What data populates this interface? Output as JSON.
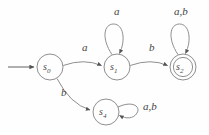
{
  "diagram": {
    "type": "finite-state-automaton",
    "stroke_color": "#8a8a8a",
    "text_color": "#3f3f3f",
    "background_color": "#fefefe",
    "alphabet": [
      "a",
      "b"
    ],
    "states": [
      {
        "id": "s0",
        "label": "s",
        "subscript": "0",
        "cx": 50,
        "cy": 67,
        "r": 13,
        "accepting": false,
        "start": true
      },
      {
        "id": "s1",
        "label": "s",
        "subscript": "1",
        "cx": 117,
        "cy": 67,
        "r": 13,
        "accepting": false,
        "start": false
      },
      {
        "id": "s2",
        "label": "s",
        "subscript": "2",
        "cx": 183,
        "cy": 67,
        "r": 13,
        "accepting": true,
        "start": false
      },
      {
        "id": "s4",
        "label": "s",
        "subscript": "4",
        "cx": 106,
        "cy": 112,
        "r": 13,
        "accepting": false,
        "start": false
      }
    ],
    "transitions": [
      {
        "id": "t-start",
        "from": "start",
        "to": "s0",
        "label": ""
      },
      {
        "id": "t-s0-s1",
        "from": "s0",
        "to": "s1",
        "label": "a",
        "label_x": 82,
        "label_y": 48
      },
      {
        "id": "t-s1-s1",
        "from": "s1",
        "to": "s1",
        "label": "a",
        "label_x": 114,
        "label_y": 12,
        "self_loop": true
      },
      {
        "id": "t-s1-s2",
        "from": "s1",
        "to": "s2",
        "label": "b",
        "label_x": 149,
        "label_y": 48
      },
      {
        "id": "t-s2-s2",
        "from": "s2",
        "to": "s2",
        "label": "a,b",
        "label_x": 176,
        "label_y": 12,
        "self_loop": true
      },
      {
        "id": "t-s0-s4",
        "from": "s0",
        "to": "s4",
        "label": "b",
        "label_x": 62,
        "label_y": 93
      },
      {
        "id": "t-s4-s4",
        "from": "s4",
        "to": "s4",
        "label": "a,b",
        "label_x": 145,
        "label_y": 106,
        "self_loop": true
      }
    ]
  }
}
